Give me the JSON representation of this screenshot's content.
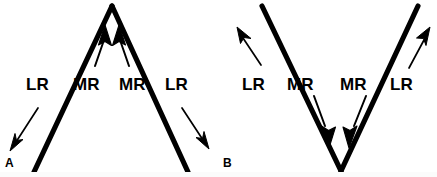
{
  "figure": {
    "background_color": "#ffffff",
    "stroke_color": "#000000",
    "width": 437,
    "height": 177
  },
  "panels": [
    {
      "id": "A",
      "letter": "A",
      "pattern_name": "A-pattern",
      "shape": "inverted-v",
      "apex_position": "top",
      "labels": [
        {
          "text": "LR",
          "muscle": "lateral rectus",
          "side": "left"
        },
        {
          "text": "MR",
          "muscle": "medial rectus",
          "side": "left"
        },
        {
          "text": "MR",
          "muscle": "medial rectus",
          "side": "right"
        },
        {
          "text": "LR",
          "muscle": "lateral rectus",
          "side": "right"
        }
      ],
      "arrows": [
        {
          "name": "lr-left-arrow",
          "weight": "thin",
          "direction": "down-left"
        },
        {
          "name": "mr-left-arrow",
          "weight": "thick",
          "direction": "up"
        },
        {
          "name": "mr-right-arrow",
          "weight": "thick",
          "direction": "up"
        },
        {
          "name": "lr-right-arrow",
          "weight": "thin",
          "direction": "down-right"
        }
      ]
    },
    {
      "id": "B",
      "letter": "B",
      "pattern_name": "V-pattern",
      "shape": "v",
      "apex_position": "bottom",
      "labels": [
        {
          "text": "LR",
          "muscle": "lateral rectus",
          "side": "left"
        },
        {
          "text": "MR",
          "muscle": "medial rectus",
          "side": "left"
        },
        {
          "text": "MR",
          "muscle": "medial rectus",
          "side": "right"
        },
        {
          "text": "LR",
          "muscle": "lateral rectus",
          "side": "right"
        }
      ],
      "arrows": [
        {
          "name": "lr-left-arrow",
          "weight": "thin",
          "direction": "up-left"
        },
        {
          "name": "mr-left-arrow",
          "weight": "thick",
          "direction": "down"
        },
        {
          "name": "mr-right-arrow",
          "weight": "thick",
          "direction": "down"
        },
        {
          "name": "lr-right-arrow",
          "weight": "thin",
          "direction": "up-right"
        }
      ]
    }
  ]
}
